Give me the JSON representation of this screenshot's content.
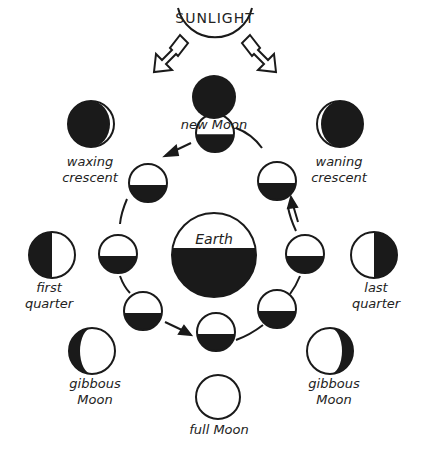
{
  "colors": {
    "ink": "#1a1a1a",
    "background": "#ffffff",
    "lit": "#ffffff"
  },
  "sunlight": {
    "label": "SUNLIGHT",
    "icon": "sunlight-arrows-icon"
  },
  "earth": {
    "label": "Earth"
  },
  "phases": [
    {
      "id": "new",
      "line1": "new Moon",
      "line2": ""
    },
    {
      "id": "waxing-crescent",
      "line1": "waxing",
      "line2": "crescent"
    },
    {
      "id": "waning-crescent",
      "line1": "waning",
      "line2": "crescent"
    },
    {
      "id": "first-quarter",
      "line1": "first",
      "line2": "quarter"
    },
    {
      "id": "last-quarter",
      "line1": "last",
      "line2": "quarter"
    },
    {
      "id": "waxing-gibbous",
      "line1": "gibbous",
      "line2": "Moon"
    },
    {
      "id": "waning-gibbous",
      "line1": "gibbous",
      "line2": "Moon"
    },
    {
      "id": "full",
      "line1": "full Moon",
      "line2": ""
    }
  ],
  "orbit": {
    "positions": 8,
    "direction": "counterclockwise"
  }
}
